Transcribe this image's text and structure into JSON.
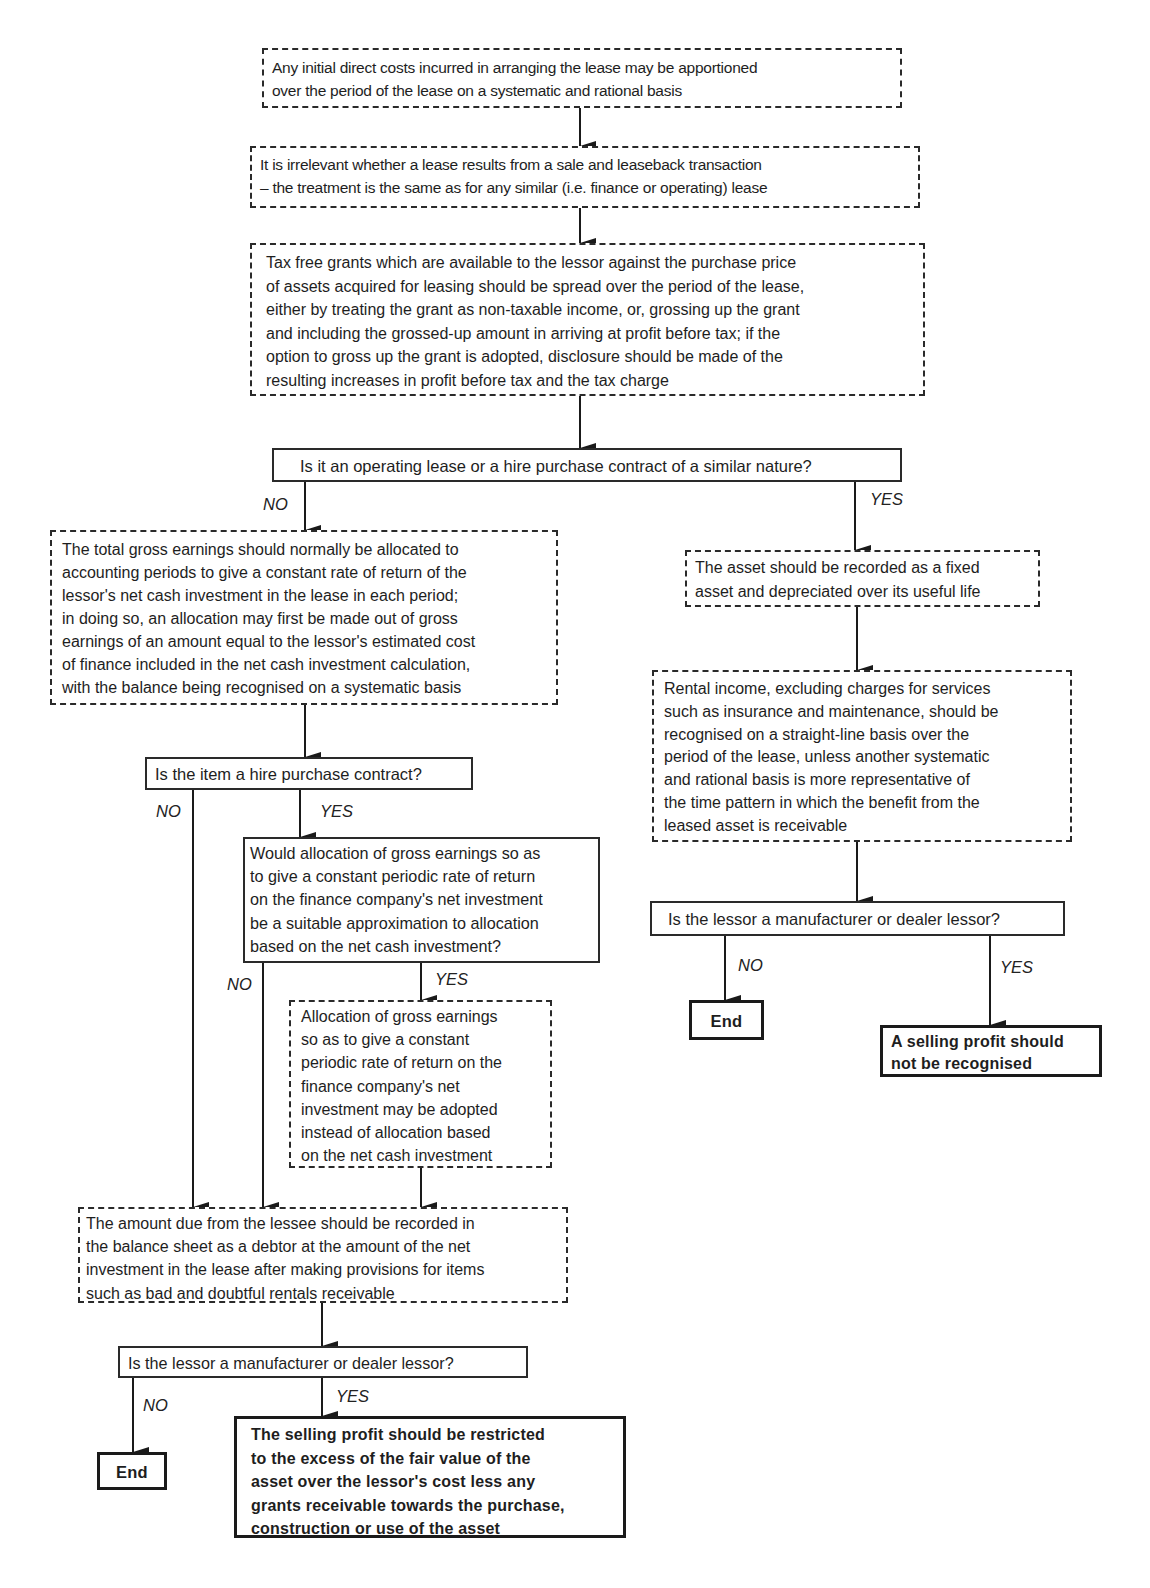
{
  "nodes": {
    "initial_costs": {
      "type": "process",
      "lines": [
        "Any initial direct costs incurred in arranging the lease may be apportioned",
        "over the period of the lease on a systematic and rational basis"
      ]
    },
    "sale_leaseback": {
      "type": "process",
      "lines": [
        "It is irrelevant whether a lease results from a sale and leaseback transaction",
        "– the treatment is the same as for any similar (i.e. finance or operating) lease"
      ]
    },
    "tax_free_grants": {
      "type": "process",
      "lines": [
        "Tax free grants which are available to the lessor against the purchase price",
        "of assets acquired for leasing should be spread over the period of the lease,",
        "either by treating the grant as non-taxable income, or, grossing up the grant",
        "and including the grossed-up amount in arriving at profit before tax; if the",
        "option to gross up the grant is adopted, disclosure should be made of the",
        "resulting increases in profit before tax and the tax charge"
      ]
    },
    "q_operating_lease": {
      "type": "decision",
      "lines": [
        "Is it an operating lease or a hire purchase contract of a similar nature?"
      ]
    },
    "gross_earnings": {
      "type": "process",
      "lines": [
        "The total gross earnings should normally be allocated to",
        "accounting periods to give a constant rate of return of the",
        "lessor's net cash investment in the lease in each period;",
        "in doing so, an allocation may first be made out of gross",
        "earnings of an amount equal to the lessor's estimated cost",
        "of finance included in the net cash investment calculation,",
        "with the balance being recognised on a systematic basis"
      ]
    },
    "fixed_asset": {
      "type": "process",
      "lines": [
        "The asset should be recorded as a fixed",
        "asset and depreciated over its useful life"
      ]
    },
    "rental_income": {
      "type": "process",
      "lines": [
        "Rental income, excluding charges for services",
        "such as insurance and maintenance, should be",
        "recognised on a straight-line basis over the",
        "period of the lease, unless another systematic",
        "and rational basis is more representative of",
        "the time pattern in which the benefit from the",
        "leased asset is receivable"
      ]
    },
    "q_hire_purchase": {
      "type": "decision",
      "lines": [
        "Is the item a hire purchase contract?"
      ]
    },
    "q_allocation": {
      "type": "decision",
      "lines": [
        "Would allocation of gross earnings so as",
        "to give a constant periodic rate of return",
        "on the finance company's net investment",
        "be a suitable approximation to allocation",
        "based on the net cash investment?"
      ]
    },
    "allocation_adopted": {
      "type": "process",
      "lines": [
        "Allocation of gross earnings",
        "so as to give a constant",
        "periodic rate of return on the",
        "finance company's net",
        "investment may be adopted",
        "instead of allocation based",
        "on the net cash investment"
      ]
    },
    "debtor": {
      "type": "process",
      "lines": [
        "The amount due from the lessee should be recorded in",
        "the balance sheet as a debtor at the amount of the net",
        "investment in the lease after making provisions for items",
        "such as bad and doubtful rentals receivable"
      ]
    },
    "q_dealer_left": {
      "type": "decision",
      "lines": [
        "Is the lessor a manufacturer or dealer lessor?"
      ]
    },
    "end_left": {
      "type": "terminal",
      "lines": [
        "End"
      ]
    },
    "selling_profit_restricted": {
      "type": "terminal",
      "lines": [
        "The selling profit should be restricted",
        "to the excess of the fair value of the",
        "asset over the lessor's cost less any",
        "grants receivable towards the purchase,",
        "construction or use of the asset"
      ]
    },
    "q_dealer_right": {
      "type": "decision",
      "lines": [
        "Is the lessor a manufacturer or dealer lessor?"
      ]
    },
    "end_right": {
      "type": "terminal",
      "lines": [
        "End"
      ]
    },
    "no_selling_profit": {
      "type": "terminal",
      "lines": [
        "A selling profit should",
        "not be recognised"
      ]
    }
  },
  "labels": {
    "no": "NO",
    "yes": "YES"
  },
  "edges": [
    {
      "from": "initial_costs",
      "to": "sale_leaseback",
      "label": ""
    },
    {
      "from": "sale_leaseback",
      "to": "tax_free_grants",
      "label": ""
    },
    {
      "from": "tax_free_grants",
      "to": "q_operating_lease",
      "label": ""
    },
    {
      "from": "q_operating_lease",
      "to": "gross_earnings",
      "label": "NO"
    },
    {
      "from": "q_operating_lease",
      "to": "fixed_asset",
      "label": "YES"
    },
    {
      "from": "gross_earnings",
      "to": "q_hire_purchase",
      "label": ""
    },
    {
      "from": "q_hire_purchase",
      "to": "debtor",
      "label": "NO"
    },
    {
      "from": "q_hire_purchase",
      "to": "q_allocation",
      "label": "YES"
    },
    {
      "from": "q_allocation",
      "to": "debtor",
      "label": "NO"
    },
    {
      "from": "q_allocation",
      "to": "allocation_adopted",
      "label": "YES"
    },
    {
      "from": "allocation_adopted",
      "to": "debtor",
      "label": ""
    },
    {
      "from": "debtor",
      "to": "q_dealer_left",
      "label": ""
    },
    {
      "from": "q_dealer_left",
      "to": "end_left",
      "label": "NO"
    },
    {
      "from": "q_dealer_left",
      "to": "selling_profit_restricted",
      "label": "YES"
    },
    {
      "from": "fixed_asset",
      "to": "rental_income",
      "label": ""
    },
    {
      "from": "rental_income",
      "to": "q_dealer_right",
      "label": ""
    },
    {
      "from": "q_dealer_right",
      "to": "end_right",
      "label": "NO"
    },
    {
      "from": "q_dealer_right",
      "to": "no_selling_profit",
      "label": "YES"
    }
  ]
}
